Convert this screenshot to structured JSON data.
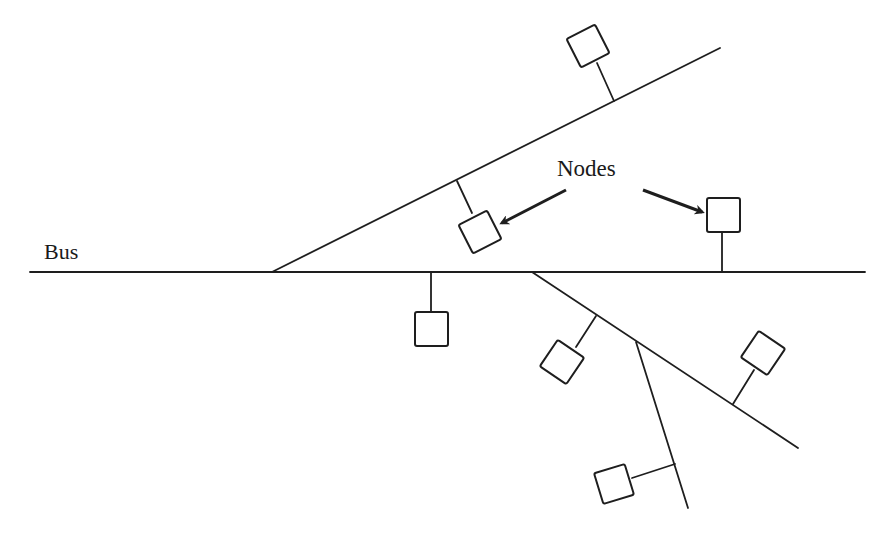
{
  "diagram": {
    "type": "bus network topology",
    "labels": {
      "bus": "Bus",
      "nodes": "Nodes"
    },
    "colors": {
      "line": "#1e1e1e",
      "background": "#ffffff"
    },
    "elements": {
      "bus_line": {
        "from": [
          30,
          272
        ],
        "to": [
          865,
          272
        ]
      },
      "branches": [
        {
          "name": "upper-branch",
          "from": [
            272,
            272
          ],
          "to": [
            720,
            48
          ]
        },
        {
          "name": "lower-branch",
          "from": [
            532,
            272
          ],
          "to": [
            798,
            448
          ]
        },
        {
          "name": "lower-sub-branch",
          "from": [
            636,
            342
          ],
          "to": [
            688,
            508
          ]
        }
      ],
      "node_count": 8,
      "arrows": 2
    }
  }
}
